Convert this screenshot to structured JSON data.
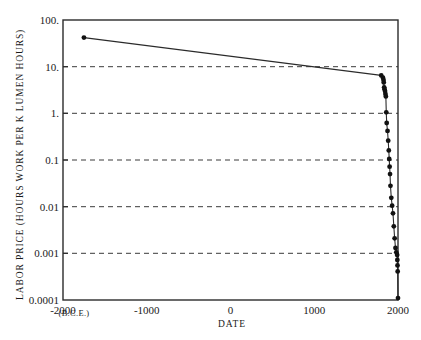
{
  "chart_data": {
    "type": "line",
    "title": "",
    "subtitle": "",
    "xlabel": "DATE",
    "xlabel_note": "(B.C.E.)",
    "ylabel": "LABOR PRICE (HOURS WORK PER K LUMEN HOURS)",
    "xlim": [
      -2000,
      2000
    ],
    "ylim": [
      0.0001,
      100
    ],
    "yscale": "log",
    "xscale": "linear",
    "grid": "horizontal-dashed",
    "legend": "none",
    "xticks": [
      -2000,
      -1000,
      0,
      1000,
      2000
    ],
    "xtick_labels": [
      "-2000",
      "-1000",
      "0",
      "1000",
      "2000"
    ],
    "yticks": [
      100,
      10,
      1,
      0.1,
      0.01,
      0.001,
      0.0001
    ],
    "ytick_labels": [
      "100.",
      "10.",
      "1.",
      "0.1",
      "0.01",
      "0.001",
      "0.0001"
    ],
    "marker": "filled-circle",
    "series": [
      {
        "name": "labor price of light",
        "x": [
          -1750,
          1800,
          1820,
          1827,
          1830,
          1835,
          1840,
          1845,
          1850,
          1855,
          1860,
          1865,
          1875,
          1883,
          1890,
          1895,
          1900,
          1905,
          1910,
          1920,
          1930,
          1940,
          1950,
          1960,
          1970,
          1980,
          1990,
          1992,
          1994,
          1996,
          2000
        ],
        "y": [
          42.0,
          6.5,
          5.8,
          5.2,
          4.6,
          3.6,
          3.3,
          3.0,
          2.6,
          2.3,
          1.05,
          0.62,
          0.42,
          0.26,
          0.16,
          0.105,
          0.072,
          0.05,
          0.028,
          0.0155,
          0.0105,
          0.0072,
          0.0038,
          0.0021,
          0.0013,
          0.00105,
          0.00092,
          0.00072,
          0.00055,
          0.00041,
          0.00011
        ]
      }
    ]
  },
  "axes": {
    "y_title": "LABOR PRICE (HOURS WORK PER K LUMEN HOURS)",
    "x_title": "DATE",
    "bce_note": "(B.C.E.)"
  }
}
